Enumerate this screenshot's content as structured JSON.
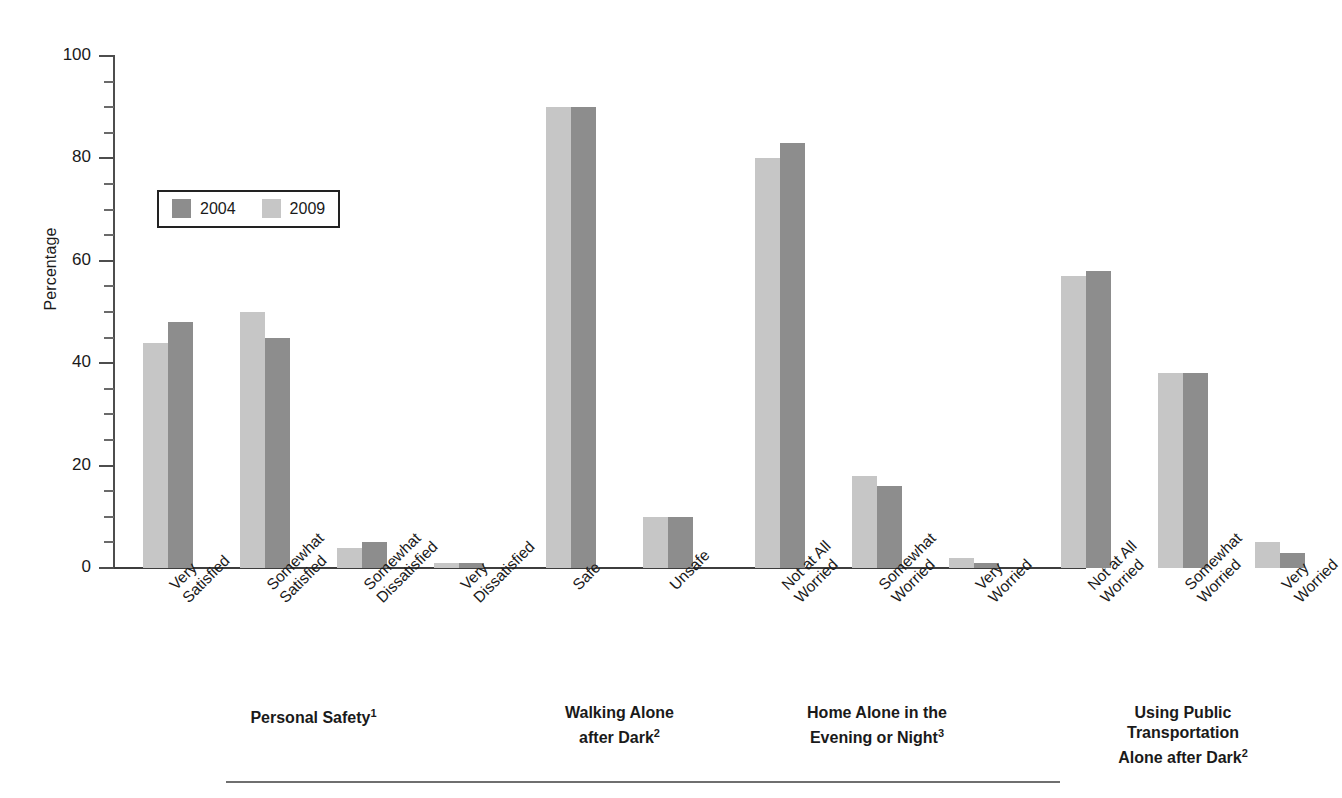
{
  "chart_data": {
    "type": "bar",
    "title": "",
    "xlabel": "",
    "ylabel": "Percentage",
    "ylim": [
      0,
      100
    ],
    "ytick_labels": [
      "0",
      "20",
      "40",
      "60",
      "80",
      "100"
    ],
    "ytick_values": [
      0,
      20,
      40,
      60,
      80,
      100
    ],
    "yminor_step": 5,
    "grid": false,
    "legend_position": "upper-left-inside",
    "series": [
      {
        "name": "2004",
        "color": "#8d8d8d"
      },
      {
        "name": "2009",
        "color": "#c6c6c6"
      }
    ],
    "bar_order_in_group": [
      "2009",
      "2004"
    ],
    "groups": [
      {
        "title": "Personal Safety",
        "title_superscript": "1",
        "categories": [
          {
            "label_lines": [
              "Very",
              "Satisfied"
            ],
            "values": {
              "2009": 44,
              "2004": 48
            }
          },
          {
            "label_lines": [
              "Somewhat",
              "Satisfied"
            ],
            "values": {
              "2009": 50,
              "2004": 45
            }
          },
          {
            "label_lines": [
              "Somewhat",
              "Dissatisfied"
            ],
            "values": {
              "2009": 4,
              "2004": 5
            }
          },
          {
            "label_lines": [
              "Very",
              "Dissatisfied"
            ],
            "values": {
              "2009": 1,
              "2004": 1
            }
          }
        ]
      },
      {
        "title": "Walking Alone after Dark",
        "title_superscript": "2",
        "title_lines": [
          "Walking Alone",
          "after Dark"
        ],
        "categories": [
          {
            "label_lines": [
              "Safe"
            ],
            "values": {
              "2009": 90,
              "2004": 90
            }
          },
          {
            "label_lines": [
              "Unsafe"
            ],
            "values": {
              "2009": 10,
              "2004": 10
            }
          }
        ]
      },
      {
        "title": "Home Alone in the Evening or Night",
        "title_superscript": "3",
        "title_lines": [
          "Home Alone in the",
          "Evening or Night"
        ],
        "categories": [
          {
            "label_lines": [
              "Not at All",
              "Worried"
            ],
            "values": {
              "2009": 80,
              "2004": 83
            }
          },
          {
            "label_lines": [
              "Somewhat",
              "Worried"
            ],
            "values": {
              "2009": 18,
              "2004": 16
            }
          },
          {
            "label_lines": [
              "Very",
              "Worried"
            ],
            "values": {
              "2009": 2,
              "2004": 1
            }
          }
        ]
      },
      {
        "title": "Using Public Transportation Alone after Dark",
        "title_superscript": "2",
        "title_lines": [
          "Using Public",
          "Transportation",
          "Alone after Dark"
        ],
        "categories": [
          {
            "label_lines": [
              "Not at All",
              "Worried"
            ],
            "values": {
              "2009": 57,
              "2004": 58
            }
          },
          {
            "label_lines": [
              "Somewhat",
              "Worried"
            ],
            "values": {
              "2009": 38,
              "2004": 38
            }
          },
          {
            "label_lines": [
              "Very",
              "Worried"
            ],
            "values": {
              "2009": 5,
              "2004": 3
            }
          }
        ]
      }
    ]
  },
  "axis": {
    "y_title": "Percentage",
    "ticks": [
      {
        "label": "100",
        "value": 100
      },
      {
        "label": "80",
        "value": 80
      },
      {
        "label": "60",
        "value": 60
      },
      {
        "label": "40",
        "value": 40
      },
      {
        "label": "20",
        "value": 20
      },
      {
        "label": "0",
        "value": 0
      }
    ]
  },
  "legend": {
    "entries": [
      {
        "label": "2004",
        "color": "#8d8d8d"
      },
      {
        "label": "2009",
        "color": "#c6c6c6"
      }
    ]
  },
  "colors": {
    "series_2004": "#8d8d8d",
    "series_2009": "#c6c6c6",
    "axis": "#3d3d3d",
    "text": "#1a1a1a",
    "rule": "#6f6f6f"
  }
}
